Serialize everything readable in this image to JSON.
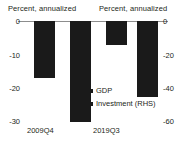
{
  "chart_data": {
    "type": "bar",
    "title": "",
    "subtitle": "",
    "xlabel": "",
    "ylabel": "Percent, annualized",
    "ylabel_right": "Percent, annualized",
    "categories": [
      "2009Q4",
      "2019Q3"
    ],
    "series": [
      {
        "name": "GDP",
        "axis": "left",
        "values": [
          -17,
          -7
        ]
      },
      {
        "name": "Investment (RHS)",
        "axis": "right",
        "values": [
          -60,
          -45
        ]
      }
    ],
    "ylim": [
      -30,
      0
    ],
    "ylim_right": [
      -60,
      0
    ],
    "yticks": [
      "0",
      "-10",
      "-20",
      "-30"
    ],
    "yticks_right": [
      "0",
      "-20",
      "-40",
      "-60"
    ],
    "grid": false,
    "legend_position": "center",
    "bar_color": "#1a1a1a",
    "axis_color": "#8d8d8d",
    "text_color": "#231f20"
  },
  "axes": {
    "left_title": "Percent, annualized",
    "right_title": "Percent, annualized"
  },
  "ticks": {
    "left": [
      {
        "label": "0",
        "top": 17
      },
      {
        "label": "-10",
        "top": 51
      },
      {
        "label": "-20",
        "top": 84
      },
      {
        "label": "-30",
        "top": 117
      }
    ],
    "right": [
      {
        "label": "0",
        "top": 17
      },
      {
        "label": "-20",
        "top": 51
      },
      {
        "label": "-40",
        "top": 84
      },
      {
        "label": "-60",
        "top": 117
      }
    ]
  },
  "bars": [
    {
      "name": "gdp-2009q4",
      "left": 9,
      "width": 21,
      "height": 57,
      "value": -17
    },
    {
      "name": "investment-2009q4",
      "left": 45,
      "width": 21,
      "height": 101,
      "value": -60
    },
    {
      "name": "gdp-2019q3",
      "left": 81,
      "width": 21,
      "height": 24,
      "value": -7
    },
    {
      "name": "investment-2019q3",
      "left": 112,
      "width": 21,
      "height": 76,
      "value": -45
    }
  ],
  "categories": [
    "2009Q4",
    "2019Q3"
  ],
  "legend": [
    {
      "label": "GDP"
    },
    {
      "label": "Investment (RHS)"
    }
  ]
}
